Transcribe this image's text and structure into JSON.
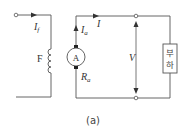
{
  "diagram": {
    "caption": "(a)",
    "field": {
      "current_label": "I",
      "current_sub": "f",
      "coil_label": "F"
    },
    "armature": {
      "machine_label": "A",
      "current_label": "I",
      "current_sub": "a",
      "resistance_label": "R",
      "resistance_sub": "a"
    },
    "output": {
      "line_current_label": "I",
      "voltage_label": "V"
    },
    "load": {
      "line1": "부",
      "line2": "하"
    },
    "colors": {
      "wire": "#555555",
      "text": "#333333",
      "background": "#ffffff"
    }
  }
}
